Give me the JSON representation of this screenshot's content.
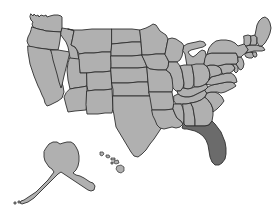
{
  "map": {
    "title": "United States choropleth map",
    "projection_note": "Contiguous United States with Alaska and Hawaii insets",
    "background_color": "#ffffff",
    "default_state_color": "#b0b0b0",
    "highlight_color": "#6b6b6b",
    "border_color": "#2f2f2f",
    "highlighted_states": [
      "Florida"
    ],
    "insets": [
      {
        "name": "Alaska",
        "position": "lower-left"
      },
      {
        "name": "Hawaii",
        "position": "lower-center"
      }
    ],
    "states": [
      {
        "code": "WA",
        "name": "Washington",
        "highlighted": false
      },
      {
        "code": "OR",
        "name": "Oregon",
        "highlighted": false
      },
      {
        "code": "CA",
        "name": "California",
        "highlighted": false
      },
      {
        "code": "NV",
        "name": "Nevada",
        "highlighted": false
      },
      {
        "code": "ID",
        "name": "Idaho",
        "highlighted": false
      },
      {
        "code": "MT",
        "name": "Montana",
        "highlighted": false
      },
      {
        "code": "WY",
        "name": "Wyoming",
        "highlighted": false
      },
      {
        "code": "UT",
        "name": "Utah",
        "highlighted": false
      },
      {
        "code": "AZ",
        "name": "Arizona",
        "highlighted": false
      },
      {
        "code": "CO",
        "name": "Colorado",
        "highlighted": false
      },
      {
        "code": "NM",
        "name": "New Mexico",
        "highlighted": false
      },
      {
        "code": "ND",
        "name": "North Dakota",
        "highlighted": false
      },
      {
        "code": "SD",
        "name": "South Dakota",
        "highlighted": false
      },
      {
        "code": "NE",
        "name": "Nebraska",
        "highlighted": false
      },
      {
        "code": "KS",
        "name": "Kansas",
        "highlighted": false
      },
      {
        "code": "OK",
        "name": "Oklahoma",
        "highlighted": false
      },
      {
        "code": "TX",
        "name": "Texas",
        "highlighted": false
      },
      {
        "code": "MN",
        "name": "Minnesota",
        "highlighted": false
      },
      {
        "code": "IA",
        "name": "Iowa",
        "highlighted": false
      },
      {
        "code": "MO",
        "name": "Missouri",
        "highlighted": false
      },
      {
        "code": "AR",
        "name": "Arkansas",
        "highlighted": false
      },
      {
        "code": "LA",
        "name": "Louisiana",
        "highlighted": false
      },
      {
        "code": "WI",
        "name": "Wisconsin",
        "highlighted": false
      },
      {
        "code": "IL",
        "name": "Illinois",
        "highlighted": false
      },
      {
        "code": "MI",
        "name": "Michigan",
        "highlighted": false
      },
      {
        "code": "IN",
        "name": "Indiana",
        "highlighted": false
      },
      {
        "code": "OH",
        "name": "Ohio",
        "highlighted": false
      },
      {
        "code": "KY",
        "name": "Kentucky",
        "highlighted": false
      },
      {
        "code": "TN",
        "name": "Tennessee",
        "highlighted": false
      },
      {
        "code": "MS",
        "name": "Mississippi",
        "highlighted": false
      },
      {
        "code": "AL",
        "name": "Alabama",
        "highlighted": false
      },
      {
        "code": "GA",
        "name": "Georgia",
        "highlighted": false
      },
      {
        "code": "FL",
        "name": "Florida",
        "highlighted": true
      },
      {
        "code": "SC",
        "name": "South Carolina",
        "highlighted": false
      },
      {
        "code": "NC",
        "name": "North Carolina",
        "highlighted": false
      },
      {
        "code": "VA",
        "name": "Virginia",
        "highlighted": false
      },
      {
        "code": "WV",
        "name": "West Virginia",
        "highlighted": false
      },
      {
        "code": "MD",
        "name": "Maryland",
        "highlighted": false
      },
      {
        "code": "DE",
        "name": "Delaware",
        "highlighted": false
      },
      {
        "code": "PA",
        "name": "Pennsylvania",
        "highlighted": false
      },
      {
        "code": "NJ",
        "name": "New Jersey",
        "highlighted": false
      },
      {
        "code": "NY",
        "name": "New York",
        "highlighted": false
      },
      {
        "code": "CT",
        "name": "Connecticut",
        "highlighted": false
      },
      {
        "code": "RI",
        "name": "Rhode Island",
        "highlighted": false
      },
      {
        "code": "MA",
        "name": "Massachusetts",
        "highlighted": false
      },
      {
        "code": "VT",
        "name": "Vermont",
        "highlighted": false
      },
      {
        "code": "NH",
        "name": "New Hampshire",
        "highlighted": false
      },
      {
        "code": "ME",
        "name": "Maine",
        "highlighted": false
      },
      {
        "code": "AK",
        "name": "Alaska",
        "highlighted": false
      },
      {
        "code": "HI",
        "name": "Hawaii",
        "highlighted": false
      }
    ]
  }
}
